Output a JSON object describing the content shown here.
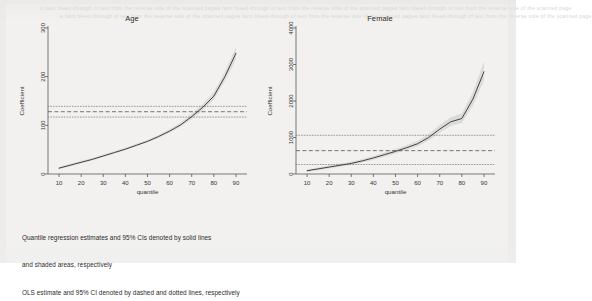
{
  "figure": {
    "background_color": "#f2f1ef",
    "ghost_text_top": "a faint bleed-through of text from the reverse side of the scanned page",
    "caption_lines": [
      "Quantile regression estimates and 95% CIs denoted by solid lines",
      "and shaded areas, respectively",
      "OLS estimate and 95% CI denoted by dashed and dotted lines, respectively"
    ]
  },
  "chart_data": [
    {
      "type": "line",
      "title": "Age",
      "xlabel": "quantile",
      "ylabel": "Coefficient",
      "xlim": [
        5,
        95
      ],
      "ylim": [
        0,
        300
      ],
      "xticks": [
        10,
        20,
        30,
        40,
        50,
        60,
        70,
        80,
        90
      ],
      "yticks": [
        0,
        100,
        200,
        300
      ],
      "grid": false,
      "legend_position": "none",
      "x": [
        10,
        15,
        20,
        25,
        30,
        35,
        40,
        45,
        50,
        55,
        60,
        65,
        70,
        75,
        80,
        85,
        90
      ],
      "series": [
        {
          "name": "Quantile regression estimate",
          "style": "solid",
          "color": "#3a3a3a",
          "values": [
            12,
            18,
            24,
            30,
            37,
            44,
            51,
            59,
            67,
            77,
            88,
            101,
            118,
            137,
            160,
            200,
            248
          ]
        },
        {
          "name": "95% CI lower (shaded area)",
          "style": "shaded",
          "color": "#c9c9c9",
          "values": [
            10,
            16,
            22,
            28,
            35,
            42,
            49,
            57,
            65,
            74,
            85,
            97,
            113,
            131,
            153,
            191,
            236
          ]
        },
        {
          "name": "95% CI upper (shaded area)",
          "style": "shaded",
          "color": "#c9c9c9",
          "values": [
            15,
            21,
            27,
            33,
            40,
            47,
            54,
            62,
            70,
            80,
            92,
            106,
            124,
            144,
            168,
            210,
            261
          ]
        }
      ],
      "reference_lines": [
        {
          "name": "OLS estimate",
          "style": "dashed",
          "value": 128,
          "color": "#555555"
        },
        {
          "name": "OLS 95% CI upper",
          "style": "dotted",
          "value": 139,
          "color": "#777777"
        },
        {
          "name": "OLS 95% CI lower",
          "style": "dotted",
          "value": 117,
          "color": "#777777"
        }
      ]
    },
    {
      "type": "line",
      "title": "Female",
      "xlabel": "quantile",
      "ylabel": "Coefficient",
      "xlim": [
        5,
        95
      ],
      "ylim": [
        0,
        4000
      ],
      "xticks": [
        10,
        20,
        30,
        40,
        50,
        60,
        70,
        80,
        90
      ],
      "yticks": [
        0,
        1000,
        2000,
        3000,
        4000
      ],
      "grid": false,
      "legend_position": "none",
      "x": [
        10,
        15,
        20,
        25,
        30,
        35,
        40,
        45,
        50,
        55,
        60,
        65,
        70,
        75,
        80,
        85,
        90
      ],
      "series": [
        {
          "name": "Quantile regression estimate",
          "style": "solid",
          "color": "#3a3a3a",
          "values": [
            90,
            140,
            190,
            240,
            290,
            360,
            440,
            530,
            620,
            720,
            830,
            1000,
            1230,
            1430,
            1520,
            2050,
            2800
          ]
        },
        {
          "name": "95% CI lower (shaded area)",
          "style": "shaded",
          "color": "#c9c9c9",
          "values": [
            60,
            105,
            150,
            200,
            248,
            315,
            390,
            475,
            560,
            655,
            760,
            915,
            1130,
            1320,
            1400,
            1880,
            2560
          ]
        },
        {
          "name": "95% CI upper (shaded area)",
          "style": "shaded",
          "color": "#c9c9c9",
          "values": [
            125,
            180,
            232,
            285,
            338,
            410,
            495,
            590,
            685,
            790,
            905,
            1090,
            1340,
            1555,
            1660,
            2240,
            3080
          ]
        }
      ],
      "reference_lines": [
        {
          "name": "OLS estimate",
          "style": "dashed",
          "value": 640,
          "color": "#555555"
        },
        {
          "name": "OLS 95% CI upper",
          "style": "dotted",
          "value": 1060,
          "color": "#777777"
        },
        {
          "name": "OLS 95% CI lower",
          "style": "dotted",
          "value": 260,
          "color": "#777777"
        }
      ]
    }
  ]
}
